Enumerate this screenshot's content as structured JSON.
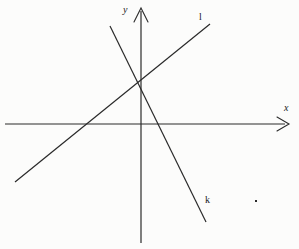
{
  "figure": {
    "type": "coordinate-plane-line-diagram",
    "background_color": "#fcfcfb",
    "stroke_color": "#2a2a2a",
    "canvas": {
      "width": 299,
      "height": 249
    }
  },
  "axes": {
    "x_axis": {
      "label": "x",
      "label_position": {
        "x": 284,
        "y": 103
      },
      "start": {
        "x": 5,
        "y": 124
      },
      "end": {
        "x": 288,
        "y": 124
      },
      "arrow": "end"
    },
    "y_axis": {
      "label": "y",
      "label_position": {
        "x": 123,
        "y": 5
      },
      "start": {
        "x": 141,
        "y": 243
      },
      "end": {
        "x": 141,
        "y": 9
      },
      "arrow": "end"
    },
    "origin": {
      "x": 141,
      "y": 124
    }
  },
  "lines": [
    {
      "label": "l",
      "label_position": {
        "x": 199,
        "y": 12
      },
      "slope_sign": "positive",
      "from": {
        "x": 15,
        "y": 182
      },
      "to": {
        "x": 210,
        "y": 24
      },
      "x_intercept_px": {
        "x": 89,
        "y": 124
      },
      "y_intercept_px": {
        "x": 141,
        "y": 85
      }
    },
    {
      "label": "k",
      "label_position": {
        "x": 205,
        "y": 195
      },
      "slope_sign": "negative",
      "from": {
        "x": 110,
        "y": 26
      },
      "to": {
        "x": 206,
        "y": 222
      },
      "x_intercept_px": {
        "x": 158,
        "y": 124
      },
      "y_intercept_px": {
        "x": 141,
        "y": 85
      }
    }
  ],
  "intersection": {
    "point": {
      "x": 141,
      "y": 85
    },
    "description": "lines l and k meet on the y-axis above the origin"
  },
  "marks": [
    {
      "name": "stray-dot",
      "position": {
        "x": 255,
        "y": 200
      },
      "size": 2
    }
  ]
}
